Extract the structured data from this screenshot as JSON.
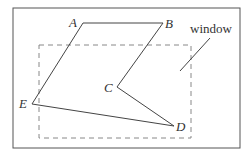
{
  "diagram": {
    "frame": {
      "x": 13,
      "y": 8,
      "width": 227,
      "height": 140,
      "stroke": "#555555"
    },
    "window_rect": {
      "x": 39,
      "y": 45,
      "width": 152,
      "height": 93,
      "stroke": "#888888",
      "dash": "5,4"
    },
    "polygon": {
      "stroke": "#444444",
      "vertices": [
        {
          "name": "A",
          "x": 83,
          "y": 23,
          "label_x": 69,
          "label_y": 27
        },
        {
          "name": "B",
          "x": 163,
          "y": 23,
          "label_x": 165,
          "label_y": 28
        },
        {
          "name": "C",
          "x": 117,
          "y": 87,
          "label_x": 104,
          "label_y": 92
        },
        {
          "name": "D",
          "x": 174,
          "y": 126,
          "label_x": 176,
          "label_y": 131
        },
        {
          "name": "E",
          "x": 32,
          "y": 104,
          "label_x": 19,
          "label_y": 108
        }
      ]
    },
    "window_label": {
      "text": "window",
      "x": 190,
      "y": 33
    },
    "leader_line": {
      "x1": 210,
      "y1": 38,
      "x2": 180,
      "y2": 71
    }
  }
}
